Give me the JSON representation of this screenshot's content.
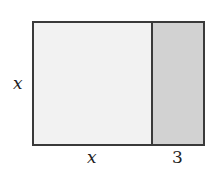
{
  "diagram": {
    "type": "area-model rectangle",
    "regions": [
      {
        "name": "square",
        "label": "x by x",
        "fill": "#f2f2f2"
      },
      {
        "name": "strip",
        "label": "x by 3",
        "fill": "#d2d2d2"
      }
    ],
    "border_color": "#3a3a3a",
    "labels": {
      "left_side": "x",
      "bottom_left": "x",
      "bottom_right": "3"
    }
  }
}
